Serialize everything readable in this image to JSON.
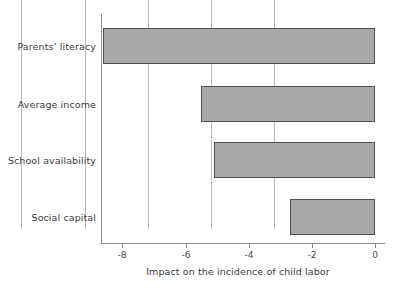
{
  "chart_data": {
    "type": "bar",
    "orientation": "horizontal",
    "title": "",
    "subtitle": "",
    "xlabel": "Impact on the incidence of child labor",
    "ylabel": "",
    "categories": [
      "Parents’ literacy",
      "Average income",
      "School availability",
      "Social capital"
    ],
    "values": [
      -8.6,
      -5.5,
      -5.1,
      -2.7
    ],
    "series": [
      {
        "name": "Impact on the incidence of child labor",
        "values": [
          -8.6,
          -5.5,
          -5.1,
          -2.7
        ]
      }
    ],
    "xlim": [
      -9.0,
      0.0
    ],
    "xticks": [
      -8,
      -6,
      -4,
      -2,
      0
    ],
    "xtick_labels": [
      "-8",
      "-6",
      "-4",
      "-2",
      "0"
    ],
    "grid": "vertical gridlines at each x tick",
    "legend": "none",
    "colors": {
      "bar_fill": "#a8a8a8",
      "bar_edge": "#4f4f4f",
      "gridline": "#b9b9b9",
      "axis": "#8d8d8d",
      "text": "#3b3b3b",
      "background": "#ffffff"
    }
  }
}
